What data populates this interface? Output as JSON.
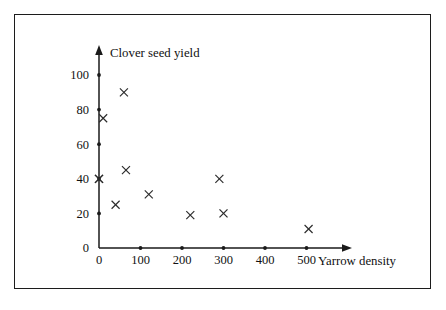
{
  "figure": {
    "background_color": "#ffffff",
    "frame_color": "#1c1c1c",
    "ink_color": "#1a1a1a",
    "marker_symbol": "x"
  },
  "chart_data": {
    "type": "scatter",
    "title": "",
    "xlabel": "Yarrow density",
    "ylabel": "Clover seed yield",
    "xlim": [
      0,
      560
    ],
    "ylim": [
      0,
      110
    ],
    "grid": false,
    "legend": false,
    "xticks": [
      0,
      100,
      200,
      300,
      400,
      500
    ],
    "xtick_labels": [
      "0",
      "100",
      "200",
      "300",
      "400",
      "500"
    ],
    "yticks": [
      0,
      20,
      40,
      60,
      80,
      100
    ],
    "ytick_labels": [
      "0",
      "20",
      "40",
      "60",
      "80",
      "100"
    ],
    "x": [
      0,
      0,
      10,
      40,
      60,
      65,
      120,
      220,
      290,
      300,
      505
    ],
    "y": [
      40,
      40,
      75,
      25,
      90,
      45,
      31,
      19,
      40,
      20,
      11
    ],
    "points": [
      {
        "x": 0,
        "y": 40
      },
      {
        "x": 0,
        "y": 40
      },
      {
        "x": 10,
        "y": 75
      },
      {
        "x": 40,
        "y": 25
      },
      {
        "x": 60,
        "y": 90
      },
      {
        "x": 65,
        "y": 45
      },
      {
        "x": 120,
        "y": 31
      },
      {
        "x": 220,
        "y": 19
      },
      {
        "x": 290,
        "y": 40
      },
      {
        "x": 300,
        "y": 20
      },
      {
        "x": 505,
        "y": 11
      }
    ]
  }
}
